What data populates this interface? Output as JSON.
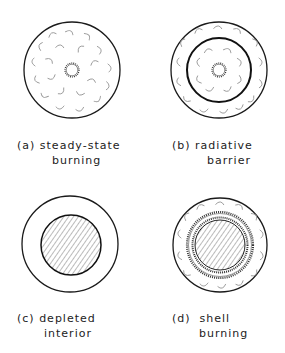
{
  "panels": [
    {
      "id": "a",
      "tag": "(a)",
      "line1": "steady-state",
      "line2": "burning",
      "features": [
        "outer-circle",
        "convective-eddies",
        "central-serrated-flame"
      ]
    },
    {
      "id": "b",
      "tag": "(b)",
      "line1": "radiative",
      "line2": "barrier",
      "features": [
        "outer-circle",
        "thick-inner-barrier-circle",
        "convective-eddies",
        "central-serrated-flame"
      ]
    },
    {
      "id": "c",
      "tag": "(c)",
      "line1": "depleted",
      "line2": "interior",
      "features": [
        "outer-circle",
        "hatched-core"
      ]
    },
    {
      "id": "d",
      "tag": "(d)",
      "line1": "shell",
      "line2": "burning",
      "features": [
        "outer-circle",
        "convective-eddies",
        "serrated-burning-shell",
        "hatched-core"
      ]
    }
  ],
  "colors": {
    "line": "#1a1a1a",
    "eddy": "#9a9a9a",
    "hatch": "#555555",
    "background": "#ffffff"
  }
}
